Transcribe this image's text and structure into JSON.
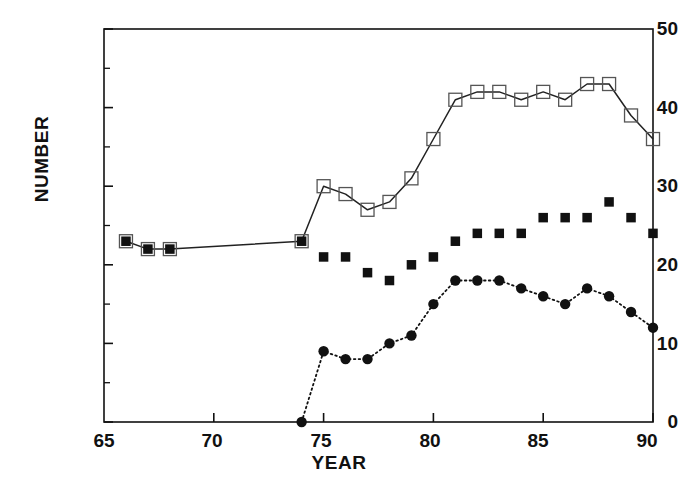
{
  "chart_data": {
    "type": "line",
    "title": "",
    "xlabel": "YEAR",
    "ylabel": "NUMBER",
    "xlim": [
      65,
      90
    ],
    "ylim": [
      0,
      50
    ],
    "xticks": [
      65,
      70,
      75,
      80,
      85,
      90
    ],
    "yticks": [
      0,
      10,
      20,
      30,
      40,
      50
    ],
    "minor_xticks": [],
    "minor_yticks": [
      5,
      15,
      25,
      35,
      45
    ],
    "grid": false,
    "legend": "none",
    "series": [
      {
        "name": "open-square-series",
        "marker": "open-square",
        "line": "solid",
        "color": "#222222",
        "x": [
          66,
          67,
          68,
          74,
          75,
          76,
          77,
          78,
          79,
          80,
          81,
          82,
          83,
          84,
          85,
          86,
          87,
          88,
          89,
          90
        ],
        "values": [
          23,
          22,
          22,
          23,
          30,
          29,
          27,
          28,
          31,
          36,
          41,
          42,
          42,
          41,
          42,
          41,
          43,
          43,
          39,
          36
        ]
      },
      {
        "name": "filled-square-series",
        "marker": "filled-square",
        "line": "none",
        "color": "#111111",
        "x": [
          75,
          76,
          77,
          78,
          79,
          80,
          81,
          82,
          83,
          84,
          85,
          86,
          87,
          88,
          89,
          90
        ],
        "values": [
          21,
          21,
          19,
          18,
          20,
          21,
          23,
          24,
          24,
          24,
          26,
          26,
          26,
          28,
          26,
          24
        ]
      },
      {
        "name": "filled-circle-series",
        "marker": "filled-circle",
        "line": "dotted",
        "color": "#111111",
        "x": [
          74,
          75,
          76,
          77,
          78,
          79,
          80,
          81,
          82,
          83,
          84,
          85,
          86,
          87,
          88,
          89,
          90
        ],
        "values": [
          0,
          9,
          8,
          8,
          10,
          11,
          15,
          18,
          18,
          18,
          17,
          16,
          15,
          17,
          16,
          14,
          12
        ]
      }
    ]
  },
  "axes": {
    "ylabel": "NUMBER",
    "xlabel": "YEAR",
    "ytick_labels": [
      "0",
      "10",
      "20",
      "30",
      "40",
      "50"
    ],
    "xtick_labels": [
      "65",
      "70",
      "75",
      "80",
      "85",
      "90"
    ]
  },
  "colors": {
    "axis": "#111111",
    "open_marker_edge": "#555555",
    "filled_marker": "#111111",
    "background": "#ffffff"
  }
}
